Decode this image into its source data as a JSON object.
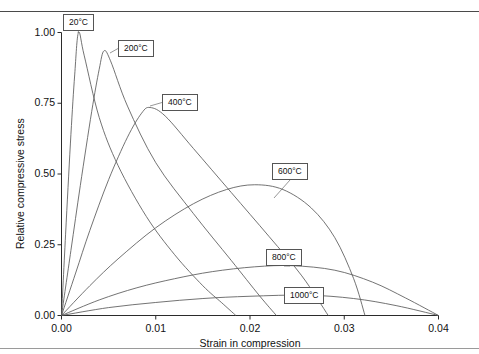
{
  "figure": {
    "cut_header_text": "",
    "background": "#ffffff",
    "curve_color": "#5a5a5a",
    "axis_color": "#2b2b2b"
  },
  "chart_data": {
    "type": "line",
    "title": "",
    "xlabel": "Strain in compression",
    "ylabel": "Relative compressive stress",
    "xlim": [
      0.0,
      0.04
    ],
    "ylim": [
      0.0,
      1.0
    ],
    "xticks": [
      "0.00",
      "0.01",
      "0.02",
      "0.03",
      "0.04"
    ],
    "xtick_values": [
      0.0,
      0.01,
      0.02,
      0.03,
      0.04
    ],
    "yticks": [
      "0.00",
      "0.25",
      "0.50",
      "0.75",
      "1.00"
    ],
    "ytick_values": [
      0.0,
      0.25,
      0.5,
      0.75,
      1.0
    ],
    "grid": false,
    "legend_position": "inline-callout-boxes",
    "series": [
      {
        "name": "20°C",
        "label": "20°C",
        "peak": {
          "x": 0.0018,
          "y": 1.0
        },
        "end": {
          "x": 0.0185,
          "y": 0.0
        },
        "points": [
          [
            0.0,
            0.0
          ],
          [
            0.0005,
            0.33
          ],
          [
            0.001,
            0.64
          ],
          [
            0.0014,
            0.85
          ],
          [
            0.0018,
            1.0
          ],
          [
            0.0024,
            0.92
          ],
          [
            0.004,
            0.7
          ],
          [
            0.006,
            0.53
          ],
          [
            0.009,
            0.35
          ],
          [
            0.012,
            0.215
          ],
          [
            0.015,
            0.105
          ],
          [
            0.017,
            0.045
          ],
          [
            0.0185,
            0.0
          ]
        ]
      },
      {
        "name": "200°C",
        "label": "200°C",
        "peak": {
          "x": 0.0045,
          "y": 0.935
        },
        "end": {
          "x": 0.0228,
          "y": 0.0
        },
        "points": [
          [
            0.0,
            0.0
          ],
          [
            0.001,
            0.23
          ],
          [
            0.002,
            0.46
          ],
          [
            0.0032,
            0.72
          ],
          [
            0.004,
            0.87
          ],
          [
            0.0045,
            0.935
          ],
          [
            0.0052,
            0.9
          ],
          [
            0.007,
            0.74
          ],
          [
            0.01,
            0.54
          ],
          [
            0.014,
            0.36
          ],
          [
            0.018,
            0.195
          ],
          [
            0.021,
            0.07
          ],
          [
            0.0228,
            0.0
          ]
        ]
      },
      {
        "name": "400°C",
        "label": "400°C",
        "peak": {
          "x": 0.0094,
          "y": 0.735
        },
        "end": {
          "x": 0.0283,
          "y": 0.0
        },
        "points": [
          [
            0.0,
            0.0
          ],
          [
            0.0015,
            0.15
          ],
          [
            0.003,
            0.3
          ],
          [
            0.005,
            0.48
          ],
          [
            0.007,
            0.63
          ],
          [
            0.0085,
            0.715
          ],
          [
            0.0094,
            0.735
          ],
          [
            0.011,
            0.705
          ],
          [
            0.014,
            0.59
          ],
          [
            0.018,
            0.435
          ],
          [
            0.022,
            0.28
          ],
          [
            0.0255,
            0.14
          ],
          [
            0.0283,
            0.0
          ]
        ]
      },
      {
        "name": "600°C",
        "label": "600°C",
        "peak": {
          "x": 0.0205,
          "y": 0.462
        },
        "end": {
          "x": 0.0322,
          "y": 0.0
        },
        "points": [
          [
            0.0,
            0.0
          ],
          [
            0.003,
            0.105
          ],
          [
            0.006,
            0.2
          ],
          [
            0.01,
            0.31
          ],
          [
            0.014,
            0.395
          ],
          [
            0.0175,
            0.445
          ],
          [
            0.0205,
            0.462
          ],
          [
            0.0235,
            0.445
          ],
          [
            0.0265,
            0.38
          ],
          [
            0.029,
            0.275
          ],
          [
            0.031,
            0.13
          ],
          [
            0.0322,
            0.0
          ]
        ]
      },
      {
        "name": "800°C",
        "label": "800°C",
        "peak": {
          "x": 0.0245,
          "y": 0.176
        },
        "end": {
          "x": 0.04,
          "y": 0.0
        },
        "points": [
          [
            0.0,
            0.0
          ],
          [
            0.004,
            0.055
          ],
          [
            0.008,
            0.098
          ],
          [
            0.012,
            0.13
          ],
          [
            0.016,
            0.155
          ],
          [
            0.0205,
            0.172
          ],
          [
            0.0245,
            0.176
          ],
          [
            0.029,
            0.16
          ],
          [
            0.033,
            0.118
          ],
          [
            0.0365,
            0.062
          ],
          [
            0.04,
            0.0
          ]
        ]
      },
      {
        "name": "1000°C",
        "label": "1000°C",
        "peak": {
          "x": 0.026,
          "y": 0.072
        },
        "end": {
          "x": 0.04,
          "y": 0.0
        },
        "points": [
          [
            0.0,
            0.0
          ],
          [
            0.005,
            0.028
          ],
          [
            0.01,
            0.046
          ],
          [
            0.015,
            0.06
          ],
          [
            0.02,
            0.068
          ],
          [
            0.026,
            0.072
          ],
          [
            0.031,
            0.06
          ],
          [
            0.0355,
            0.035
          ],
          [
            0.04,
            0.0
          ]
        ]
      }
    ],
    "callouts": [
      {
        "label": "20°C",
        "box_left": 63,
        "box_top": 14,
        "anchor_x": 78,
        "anchor_y": 33
      },
      {
        "label": "200°C",
        "box_left": 118,
        "box_top": 40,
        "anchor_x": 110,
        "anchor_y": 53
      },
      {
        "label": "400°C",
        "box_left": 162,
        "box_top": 94,
        "anchor_x": 150,
        "anchor_y": 106
      },
      {
        "label": "600°C",
        "box_left": 272,
        "box_top": 163,
        "anchor_x": 274,
        "anchor_y": 198
      },
      {
        "label": "800°C",
        "box_left": 266,
        "box_top": 249,
        "anchor_x": 290,
        "anchor_y": 266
      },
      {
        "label": "1000°C",
        "box_left": 284,
        "box_top": 287,
        "anchor_x": 306,
        "anchor_y": 301
      }
    ]
  }
}
